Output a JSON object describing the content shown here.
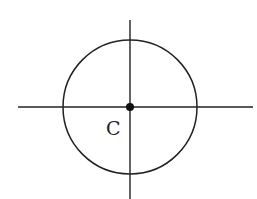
{
  "diagram": {
    "center_label": "C",
    "stroke_color": "#222222",
    "background": "#ffffff",
    "circle": {
      "cx": 130,
      "cy": 107,
      "r": 67
    },
    "horizontal_axis": {
      "x1": 18,
      "x2": 253,
      "y": 107
    },
    "vertical_axis": {
      "x": 130,
      "y1": 20,
      "y2": 199
    }
  }
}
